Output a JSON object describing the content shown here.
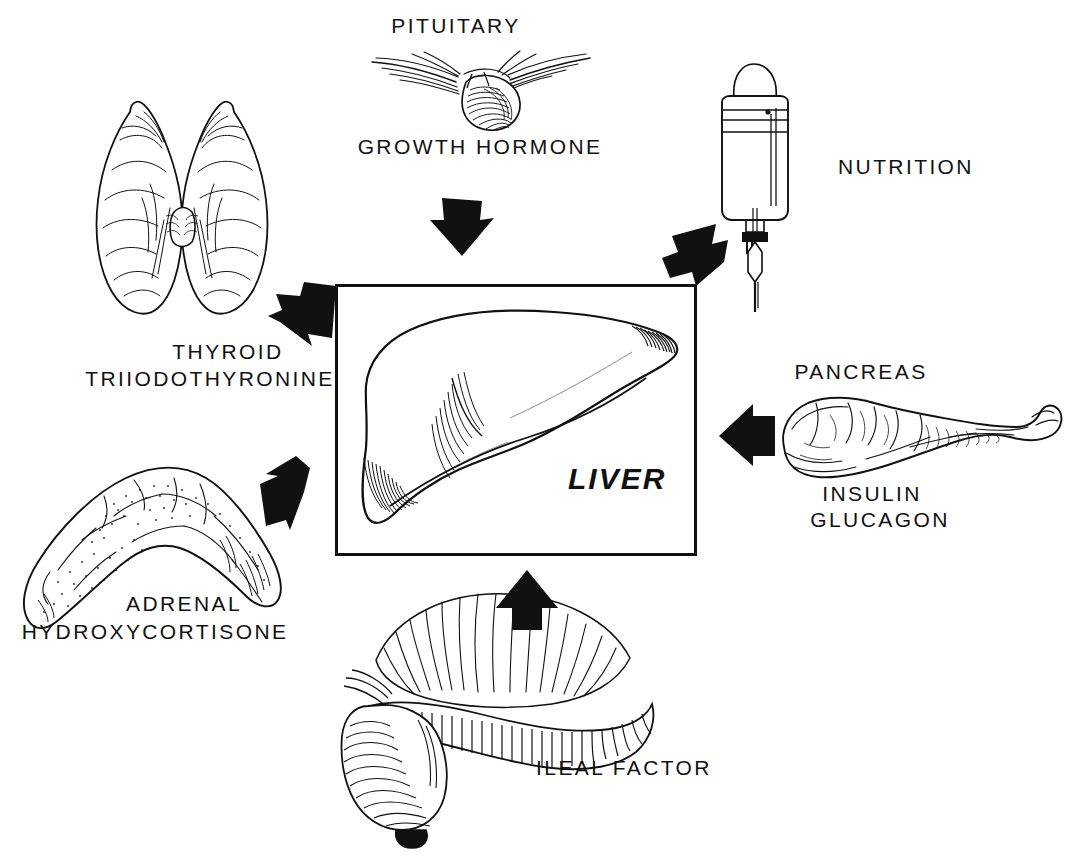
{
  "figure": {
    "center_label": "LIVER",
    "ink_color": "#111111",
    "background_color": "#ffffff"
  },
  "nodes": [
    {
      "id": "pituitary",
      "icon": "pituitary-gland-illustration",
      "label_top": "PITUITARY",
      "label_bottom": "GROWTH HORMONE",
      "arrow": "arrow-down"
    },
    {
      "id": "thyroid",
      "icon": "thyroid-gland-illustration",
      "label_top": "THYROID",
      "label_bottom": "TRIIODOTHYRONINE",
      "arrow": "arrow-left"
    },
    {
      "id": "adrenal",
      "icon": "adrenal-gland-illustration",
      "label_top": "ADRENAL",
      "label_bottom": "HYDROXYCORTISONE",
      "arrow": "arrow-up-right"
    },
    {
      "id": "nutrition",
      "icon": "iv-bag-illustration",
      "label_top": "NUTRITION",
      "label_bottom": "",
      "arrow": "arrow-down-left"
    },
    {
      "id": "pancreas",
      "icon": "pancreas-illustration",
      "label_top": "PANCREAS",
      "label_bottom": "INSULIN",
      "label_bottom2": "GLUCAGON",
      "arrow": "arrow-left"
    },
    {
      "id": "ileum",
      "icon": "ileum-illustration",
      "label_top": "ILEAL FACTOR",
      "label_bottom": "",
      "arrow": "arrow-up"
    }
  ],
  "labels": {
    "pituitary": "PITUITARY",
    "growth_hormone": "GROWTH HORMONE",
    "thyroid": "THYROID",
    "triiodothyronine": "TRIIODOTHYRONINE",
    "adrenal": "ADRENAL",
    "hydroxycortisone": "HYDROXYCORTISONE",
    "nutrition": "NUTRITION",
    "pancreas": "PANCREAS",
    "insulin": "INSULIN",
    "glucagon": "GLUCAGON",
    "ileal_factor": "ILEAL FACTOR",
    "liver": "LIVER"
  }
}
